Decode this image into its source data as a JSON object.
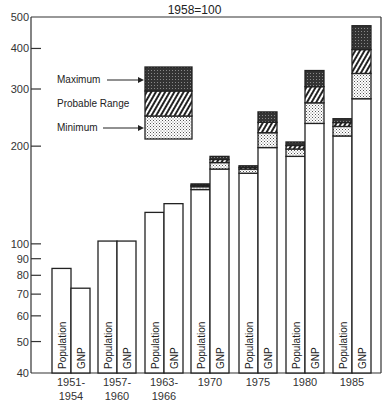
{
  "chart_data": {
    "type": "bar",
    "title_partial": "",
    "subtitle": "1958=100",
    "xlabel": "",
    "ylabel": "",
    "yscale": "log",
    "ylim": [
      40,
      500
    ],
    "yticks": [
      40,
      50,
      60,
      70,
      80,
      90,
      100,
      200,
      300,
      400,
      500
    ],
    "categories": [
      "1951-\n1954",
      "1957-\n1960",
      "1963-\n1966",
      "1970",
      "1975",
      "1980",
      "1985"
    ],
    "category_lines": [
      [
        "1951-",
        "1954"
      ],
      [
        "1957-",
        "1960"
      ],
      [
        "1963-",
        "1966"
      ],
      [
        "1970"
      ],
      [
        "1975"
      ],
      [
        "1980"
      ],
      [
        "1985"
      ]
    ],
    "series": [
      {
        "name": "Population",
        "values": [
          84,
          102,
          125,
          null,
          null,
          null,
          null
        ],
        "ranges": [
          null,
          null,
          null,
          {
            "minimum": 147,
            "probable": 150,
            "maximum": 153
          },
          {
            "minimum": 165,
            "probable": 170,
            "maximum": 174
          },
          {
            "minimum": 186,
            "probable": 196,
            "maximum": 206
          },
          {
            "minimum": 215,
            "probable": 230,
            "maximum": 243
          }
        ]
      },
      {
        "name": "GNP",
        "values": [
          73,
          102,
          133,
          null,
          null,
          null,
          null
        ],
        "ranges": [
          null,
          null,
          null,
          {
            "minimum": 170,
            "probable": 178,
            "maximum": 186
          },
          {
            "minimum": 198,
            "probable": 220,
            "maximum": 255
          },
          {
            "minimum": 235,
            "probable": 272,
            "maximum": 342
          },
          {
            "minimum": 280,
            "probable": 335,
            "maximum": 470
          }
        ]
      }
    ],
    "legend": {
      "position": "upper-left inside",
      "entries": [
        "Maximum",
        "Probable Range",
        "Minimum"
      ]
    },
    "bar_labels": [
      "Population",
      "GNP"
    ],
    "grid": false
  }
}
